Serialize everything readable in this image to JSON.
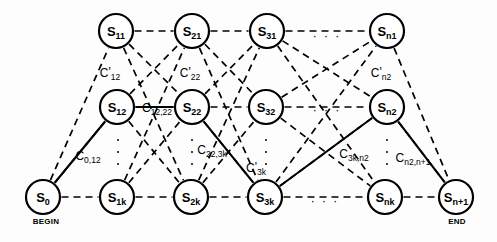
{
  "figure": {
    "type": "trellis-graph-diagram",
    "colors": {
      "node_stroke": "#000000",
      "edge_dashed": "#000000",
      "edge_solid": "#000000",
      "background": "#fdfdfd",
      "text": "#000000"
    }
  },
  "rows": [
    {
      "id": "row-1",
      "y": 31,
      "nodes": [
        {
          "id": "s11",
          "base": "S",
          "sub": "11",
          "x": 116
        },
        {
          "id": "s21",
          "base": "S",
          "sub": "21",
          "x": 192
        },
        {
          "id": "s31",
          "base": "S",
          "sub": "31",
          "x": 267
        },
        {
          "id": "sn1",
          "base": "S",
          "sub": "n1",
          "x": 387
        }
      ]
    },
    {
      "id": "row-2",
      "y": 107,
      "nodes": [
        {
          "id": "s12",
          "base": "S",
          "sub": "12",
          "x": 117
        },
        {
          "id": "s22",
          "base": "S",
          "sub": "22",
          "x": 192
        },
        {
          "id": "s32",
          "base": "S",
          "sub": "32",
          "x": 266
        },
        {
          "id": "sn2",
          "base": "S",
          "sub": "n2",
          "x": 387
        }
      ]
    },
    {
      "id": "row-3",
      "y": 197,
      "nodes": [
        {
          "id": "s0",
          "base": "S",
          "sub": "0",
          "x": 43
        },
        {
          "id": "s1k",
          "base": "S",
          "sub": "1k",
          "x": 117
        },
        {
          "id": "s2k",
          "base": "S",
          "sub": "2k",
          "x": 191
        },
        {
          "id": "s3k",
          "base": "S",
          "sub": "3k",
          "x": 265
        },
        {
          "id": "snk",
          "base": "S",
          "sub": "nk",
          "x": 385
        },
        {
          "id": "sn1plus",
          "base": "S",
          "sub": "n+1",
          "x": 456
        }
      ]
    }
  ],
  "terminal_labels": [
    {
      "id": "begin",
      "text": "BEGIN",
      "x": 46,
      "y": 221
    },
    {
      "id": "end",
      "text": "END",
      "x": 457,
      "y": 221
    }
  ],
  "edge_labels": [
    {
      "id": "c-prime-12",
      "base": "C",
      "prime": "'",
      "sub": "12",
      "x": 110,
      "y": 72
    },
    {
      "id": "c-prime-22",
      "base": "C",
      "prime": "'",
      "sub": "22",
      "x": 190,
      "y": 72
    },
    {
      "id": "c-prime-n2",
      "base": "C",
      "prime": "'",
      "sub": "n2",
      "x": 381,
      "y": 72
    },
    {
      "id": "c-12-22",
      "base": "C",
      "prime": "",
      "sub": "12,22",
      "x": 157,
      "y": 107
    },
    {
      "id": "c-0-12",
      "base": "C",
      "prime": "",
      "sub": "0,12",
      "x": 88,
      "y": 155
    },
    {
      "id": "c-22-3k",
      "base": "C",
      "prime": "",
      "sub": "22,3k",
      "x": 212,
      "y": 149
    },
    {
      "id": "c-prime-3k",
      "base": "C",
      "prime": "'",
      "sub": "3k",
      "x": 256,
      "y": 167
    },
    {
      "id": "c-3k-n2",
      "base": "C",
      "prime": "",
      "sub": "3k,n2",
      "x": 354,
      "y": 153
    },
    {
      "id": "c-n2-n1plus",
      "base": "C",
      "prime": "",
      "sub": "n2,n+1",
      "x": 413,
      "y": 157
    }
  ],
  "ellipses": [
    {
      "id": "dots-row1",
      "text": "· · ·",
      "x": 327,
      "y": 36
    },
    {
      "id": "dots-row2",
      "text": "· · ·",
      "x": 327,
      "y": 110
    },
    {
      "id": "dots-row3",
      "text": "· · ·",
      "x": 325,
      "y": 201
    }
  ],
  "vertical_ellipses": [
    {
      "id": "vdots-col-12",
      "x": 118,
      "y": 152
    },
    {
      "id": "vdots-col-22",
      "x": 192,
      "y": 152
    },
    {
      "id": "vdots-col-32",
      "x": 266,
      "y": 152
    },
    {
      "id": "vdots-col-n2",
      "x": 387,
      "y": 152
    }
  ],
  "chart_data": {
    "type": "diagram",
    "title": "",
    "node_radius": 17,
    "solid_path": [
      "s0",
      "s12",
      "s22",
      "s3k",
      "sn2",
      "sn1plus"
    ],
    "horizontal_dashed_chains": [
      [
        "s11",
        "s21",
        "s31",
        "sn1"
      ],
      [
        "s12",
        "s22",
        "s32",
        "sn2"
      ],
      [
        "s0",
        "s1k",
        "s2k",
        "s3k",
        "snk",
        "sn1plus"
      ]
    ],
    "cross_dashed_columns": [
      {
        "from_col": [
          "s0"
        ],
        "to_col": [
          "s11",
          "s12",
          "s1k"
        ]
      },
      {
        "from_col": [
          "s11",
          "s12",
          "s1k"
        ],
        "to_col": [
          "s21",
          "s22",
          "s2k"
        ]
      },
      {
        "from_col": [
          "s21",
          "s22",
          "s2k"
        ],
        "to_col": [
          "s31",
          "s32",
          "s3k"
        ]
      },
      {
        "from_col": [
          "s31",
          "s32",
          "s3k"
        ],
        "to_col": [
          "sn1",
          "sn2",
          "snk"
        ]
      },
      {
        "from_col": [
          "sn1",
          "sn2",
          "snk"
        ],
        "to_col": [
          "sn1plus"
        ]
      }
    ]
  }
}
